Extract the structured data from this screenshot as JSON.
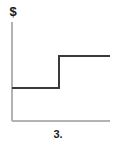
{
  "figure": {
    "caption": "3.",
    "background_color": "#ffffff"
  },
  "axes": {
    "y_label": "$",
    "y_axis_color": "#b3b3b3",
    "x_axis_color": "#b3b3b3",
    "y_axis_x": 12,
    "y_axis_top": 22,
    "y_axis_bottom": 121,
    "x_axis_y": 121,
    "x_axis_left": 12,
    "x_axis_right": 110
  },
  "chart_data": {
    "type": "line",
    "title": "3.",
    "xlabel": "",
    "ylabel": "$",
    "grid": false,
    "legend": "none",
    "subtype": "step",
    "step_style": "post",
    "series": [
      {
        "name": "step",
        "color": "#3a3a3a",
        "line_width": 2,
        "x": [
          0,
          0.55,
          0.55,
          1.0
        ],
        "y": [
          0.34,
          0.34,
          0.66,
          0.66
        ],
        "points_px": [
          {
            "x": 12,
            "y": 88
          },
          {
            "x": 59,
            "y": 88
          },
          {
            "x": 59,
            "y": 56
          },
          {
            "x": 110,
            "y": 56
          }
        ]
      }
    ],
    "xlim": [
      0,
      1
    ],
    "ylim": [
      0,
      1
    ],
    "annotations": []
  }
}
